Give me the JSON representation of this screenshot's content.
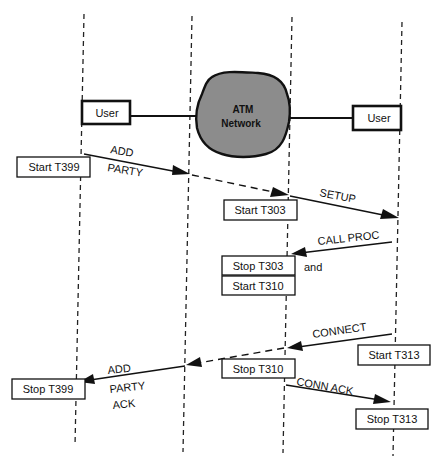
{
  "diagram": {
    "type": "sequence",
    "lifelines": [
      {
        "id": "calling-user",
        "label": "User",
        "x_top": 84,
        "x_bottom": 75
      },
      {
        "id": "network-ingress",
        "label": "",
        "x_top": 192,
        "x_bottom": 183
      },
      {
        "id": "network-egress",
        "label": "",
        "x_top": 292,
        "x_bottom": 283
      },
      {
        "id": "called-user",
        "label": "User",
        "x_top": 402,
        "x_bottom": 393
      }
    ],
    "entities": {
      "left_user": "User",
      "network_line1": "ATM",
      "network_line2": "Network",
      "right_user": "User"
    },
    "messages": [
      {
        "label_lines": [
          "ADD",
          "PARTY"
        ],
        "from": "calling-user",
        "to": "network-ingress",
        "style": "solid"
      },
      {
        "label_lines": [],
        "from": "network-ingress",
        "to": "network-egress",
        "style": "dashed"
      },
      {
        "label_lines": [
          "SETUP"
        ],
        "from": "network-egress",
        "to": "called-user",
        "style": "solid"
      },
      {
        "label_lines": [
          "CALL PROC"
        ],
        "from": "called-user",
        "to": "network-egress",
        "style": "solid"
      },
      {
        "label_lines": [
          "CONNECT"
        ],
        "from": "called-user",
        "to": "network-egress",
        "style": "solid"
      },
      {
        "label_lines": [],
        "from": "network-egress",
        "to": "network-ingress",
        "style": "dashed"
      },
      {
        "label_lines": [
          "ADD",
          "PARTY",
          "ACK"
        ],
        "from": "network-ingress",
        "to": "calling-user",
        "style": "solid"
      },
      {
        "label_lines": [
          "CONN ACK"
        ],
        "from": "network-egress",
        "to": "called-user",
        "style": "solid"
      }
    ],
    "timers": {
      "start_t399": "Start T399",
      "start_t303": "Start T303",
      "stop_t303": "Stop T303",
      "and": "and",
      "start_t310": "Start T310",
      "start_t313": "Start T313",
      "stop_t310": "Stop T310",
      "stop_t399": "Stop T399",
      "stop_t313": "Stop T313"
    },
    "message_labels": {
      "add_party_1": "ADD",
      "add_party_2": "PARTY",
      "setup": "SETUP",
      "call_proc": "CALL PROC",
      "connect": "CONNECT",
      "ack_1": "ADD",
      "ack_2": "PARTY",
      "ack_3": "ACK",
      "conn_ack": "CONN ACK"
    }
  }
}
